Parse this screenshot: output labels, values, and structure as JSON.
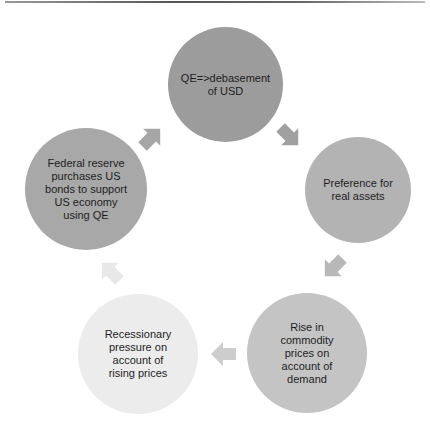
{
  "diagram": {
    "type": "cycle",
    "nodes": [
      {
        "id": "top",
        "label": "QE=>debasement\nof  USD",
        "fill": "#9c9c9c",
        "x": 168,
        "y": 27,
        "size": 115
      },
      {
        "id": "right",
        "label": "Preference for\nreal assets",
        "fill": "#b3b3b3",
        "x": 305,
        "y": 137,
        "size": 106
      },
      {
        "id": "bottom-right",
        "label": "Rise in\ncommodity\nprices on\naccount of\ndemand",
        "fill": "#c4c4c4",
        "x": 247,
        "y": 293,
        "size": 120
      },
      {
        "id": "bottom-left",
        "label": "Recessionary\npressure on\naccount of\nrising prices",
        "fill": "#ececec",
        "x": 78,
        "y": 294,
        "size": 120
      },
      {
        "id": "left",
        "label": "Federal reserve\npurchases US\nbonds to support\nUS economy\nusing QE",
        "fill": "#a8a8a8",
        "x": 25,
        "y": 128,
        "size": 122
      }
    ],
    "arrows": [
      {
        "id": "left-to-top",
        "direction": "up-right",
        "rotate": -45,
        "fill": "#a6a6a6",
        "x": 137,
        "y": 124
      },
      {
        "id": "top-to-right",
        "direction": "down-right",
        "rotate": 45,
        "fill": "#a0a0a0",
        "x": 275,
        "y": 122
      },
      {
        "id": "right-to-bottom-right",
        "direction": "down-left",
        "rotate": 135,
        "fill": "#b8b8b8",
        "x": 320,
        "y": 253
      },
      {
        "id": "bottom-right-to-bottom-left",
        "direction": "left",
        "rotate": 180,
        "fill": "#cdcdcd",
        "x": 210,
        "y": 340
      },
      {
        "id": "bottom-left-to-left",
        "direction": "up-left",
        "rotate": -135,
        "fill": "#e8e8e8",
        "x": 97,
        "y": 258
      }
    ]
  },
  "colors": {
    "background": "#ffffff",
    "text": "#1e1e1e"
  }
}
